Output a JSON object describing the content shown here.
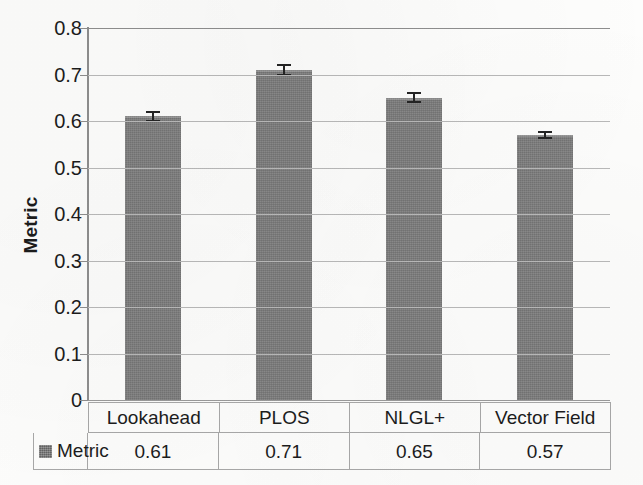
{
  "chart_data": {
    "type": "bar",
    "title": "",
    "xlabel": "",
    "ylabel": "Metric",
    "ylim": [
      0,
      0.8
    ],
    "ytick_labels": [
      "0.8",
      "0.7",
      "0.6",
      "0.5",
      "0.4",
      "0.3",
      "0.2",
      "0.1",
      "0"
    ],
    "ytick_values": [
      0.8,
      0.7,
      0.6,
      0.5,
      0.4,
      0.3,
      0.2,
      0.1,
      0
    ],
    "grid": true,
    "legend_position": "bottom-table",
    "categories": [
      "Lookahead",
      "PLOS",
      "NLGL+",
      "Vector Field"
    ],
    "series": [
      {
        "name": "Metric",
        "color": "#7e7e7e",
        "values": [
          0.61,
          0.71,
          0.65,
          0.57
        ],
        "value_labels": [
          "0.61",
          "0.71",
          "0.65",
          "0.57"
        ],
        "errors": [
          0.012,
          0.013,
          0.012,
          0.008
        ]
      }
    ],
    "data_table": {
      "header_row": [
        "Lookahead",
        "PLOS",
        "NLGL+",
        "Vector Field"
      ],
      "rows": [
        {
          "label": "Metric",
          "swatch_color": "#7e7e7e",
          "cells": [
            "0.61",
            "0.71",
            "0.65",
            "0.57"
          ]
        }
      ]
    }
  },
  "axis": {
    "y_title": "Metric",
    "y_ticks": [
      "0.8",
      "0.7",
      "0.6",
      "0.5",
      "0.4",
      "0.3",
      "0.2",
      "0.1",
      "0"
    ]
  },
  "legend": {
    "series_label": "Metric"
  }
}
